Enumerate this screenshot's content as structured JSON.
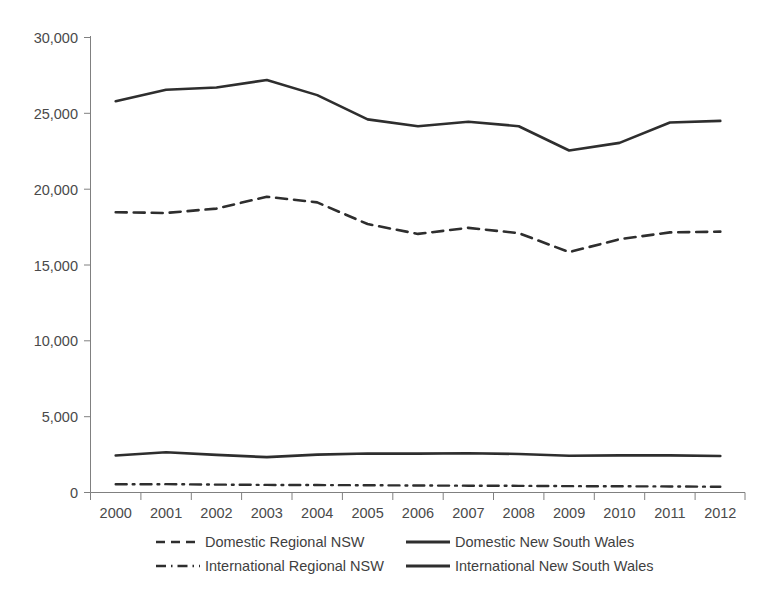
{
  "chart_data": {
    "type": "line",
    "title": "",
    "subtitle": "",
    "xlabel": "",
    "ylabel": "",
    "grid": false,
    "legend_position": "bottom",
    "x": [
      2000,
      2001,
      2002,
      2003,
      2004,
      2005,
      2006,
      2007,
      2008,
      2009,
      2010,
      2011,
      2012
    ],
    "categories": [
      "2000",
      "2001",
      "2002",
      "2003",
      "2004",
      "2005",
      "2006",
      "2007",
      "2008",
      "2009",
      "2010",
      "2011",
      "2012"
    ],
    "ylim": [
      0,
      30000
    ],
    "yticks": [
      0,
      5000,
      10000,
      15000,
      20000,
      25000,
      30000
    ],
    "ytick_labels": [
      "0",
      "5,000",
      "10,000",
      "15,000",
      "20,000",
      "25,000",
      "30,000"
    ],
    "series": [
      {
        "name": "Domestic Regional NSW",
        "style": "dashed",
        "color": "#2e2e2e",
        "values": [
          18480,
          18430,
          18720,
          19500,
          19130,
          17700,
          17050,
          17450,
          17100,
          15850,
          16700,
          17150,
          17200
        ]
      },
      {
        "name": "Domestic New South Wales",
        "style": "solid",
        "color": "#2e2e2e",
        "values": [
          25800,
          26550,
          26700,
          27200,
          26200,
          24600,
          24150,
          24450,
          24150,
          22550,
          23050,
          24400,
          24500
        ]
      },
      {
        "name": "International Regional NSW",
        "style": "dash-dot",
        "color": "#2e2e2e",
        "values": [
          540,
          550,
          520,
          500,
          490,
          480,
          460,
          450,
          440,
          420,
          410,
          400,
          380
        ]
      },
      {
        "name": "International New South Wales",
        "style": "solid",
        "color": "#2e2e2e",
        "values": [
          2440,
          2650,
          2480,
          2330,
          2500,
          2570,
          2560,
          2590,
          2540,
          2420,
          2450,
          2450,
          2410
        ]
      }
    ]
  },
  "axis": {
    "ytick_labels": [
      "30,000",
      "25,000",
      "20,000",
      "15,000",
      "10,000",
      "5,000",
      "0"
    ],
    "xtick_labels": [
      "2000",
      "2001",
      "2002",
      "2003",
      "2004",
      "2005",
      "2006",
      "2007",
      "2008",
      "2009",
      "2010",
      "2011",
      "2012"
    ]
  },
  "legend": {
    "entries": [
      {
        "label": "Domestic Regional NSW",
        "style": "dashed"
      },
      {
        "label": "Domestic New South Wales",
        "style": "solid"
      },
      {
        "label": "International Regional NSW",
        "style": "dash-dot"
      },
      {
        "label": "International New South Wales",
        "style": "solid"
      }
    ]
  },
  "colors": {
    "line": "#2e2e2e",
    "axis": "#808080",
    "text": "#4a4a4a",
    "background": "#ffffff"
  }
}
